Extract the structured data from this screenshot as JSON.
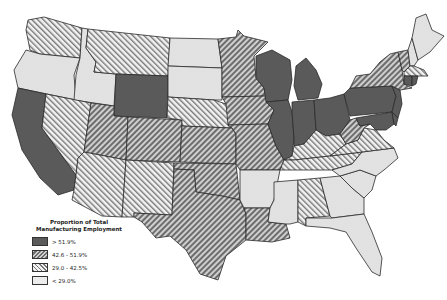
{
  "legend": {
    "title_line1": "Proportion of Total",
    "title_line2": "Manufacturing Employment",
    "classes": [
      {
        "label": "> 51.9%",
        "pattern": "solid-dark",
        "color": "#5a5a5a"
      },
      {
        "label": "42.6 - 51.9%",
        "pattern": "forward-hatch",
        "color": "#7a7a7a"
      },
      {
        "label": "29.0 - 42.5%",
        "pattern": "back-hatch",
        "color": "#9a9a9a"
      },
      {
        "label": "< 29.0%",
        "pattern": "dotted",
        "color": "#d8d8d8"
      }
    ]
  },
  "states": {
    "WA": "back-hatch",
    "OR": "dotted",
    "CA": "solid-dark",
    "ID": "dotted",
    "NV": "back-hatch",
    "MT": "back-hatch",
    "WY": "solid-dark",
    "UT": "forward-hatch",
    "AZ": "back-hatch",
    "CO": "forward-hatch",
    "NM": "back-hatch",
    "ND": "dotted",
    "SD": "dotted",
    "NE": "back-hatch",
    "KS": "forward-hatch",
    "OK": "forward-hatch",
    "TX": "forward-hatch",
    "MN": "forward-hatch",
    "IA": "forward-hatch",
    "MO": "forward-hatch",
    "AR": "dotted",
    "LA": "forward-hatch",
    "WI": "solid-dark",
    "IL": "solid-dark",
    "MI": "solid-dark",
    "IN": "solid-dark",
    "OH": "solid-dark",
    "KY": "back-hatch",
    "TN": "back-hatch",
    "MS": "dotted",
    "AL": "back-hatch",
    "GA": "dotted",
    "FL": "dotted",
    "SC": "dotted",
    "NC": "dotted",
    "VA": "back-hatch",
    "WV": "forward-hatch",
    "PA": "solid-dark",
    "NY": "forward-hatch",
    "VT": "forward-hatch",
    "NH": "dotted",
    "ME": "dotted",
    "MA": "back-hatch",
    "CT": "solid-dark",
    "NJ": "solid-dark",
    "MD": "solid-dark",
    "DE": "solid-dark",
    "RI": "solid-dark"
  }
}
